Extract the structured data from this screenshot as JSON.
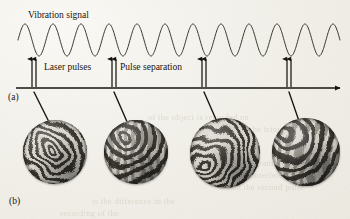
{
  "figure": {
    "caption_panels": [
      "(a)",
      "(b)"
    ],
    "background_color": "#f2f0e9",
    "ink_color": "#16150f"
  },
  "panel_a": {
    "label": "(a)",
    "signal_label": "Vibration signal",
    "laser_pulses_label": "Laser pulses",
    "pulse_separation_label": "Pulse separation",
    "axis": {
      "y": 88,
      "x_start": 16,
      "x_end": 340,
      "arrowhead": "right-arrow-icon"
    },
    "waveform": {
      "type": "sine",
      "cycles": 11.5,
      "x_start": 18,
      "x_end": 340,
      "baseline_y": 40,
      "amplitude": 16,
      "stroke_width": 0.9
    },
    "pulse_pairs": [
      {
        "index": 1,
        "x": 32,
        "separation": 4,
        "arrows": 2
      },
      {
        "index": 2,
        "x": 112,
        "separation": 4,
        "arrows": 2
      },
      {
        "index": 3,
        "x": 202,
        "separation": 4,
        "arrows": 2
      },
      {
        "index": 4,
        "x": 287,
        "separation": 4,
        "arrows": 2
      }
    ],
    "leader_lines": [
      {
        "from_x": 34,
        "from_y": 92,
        "to_x": 50,
        "to_y": 124
      },
      {
        "from_x": 114,
        "from_y": 92,
        "to_x": 128,
        "to_y": 124
      },
      {
        "from_x": 204,
        "from_y": 92,
        "to_x": 218,
        "to_y": 124
      },
      {
        "from_x": 289,
        "from_y": 92,
        "to_x": 300,
        "to_y": 124
      }
    ]
  },
  "panel_b": {
    "label": "(b)",
    "interferograms": [
      {
        "index": 1,
        "name": "interferogram-1",
        "x": 23,
        "y": 120,
        "size": 64,
        "pattern": "concentric-radial-fringes",
        "fringe_count": 26,
        "center_x": 48,
        "center_y": 46,
        "swirl": 38,
        "base_color": "#8f8c84"
      },
      {
        "index": 2,
        "name": "interferogram-2",
        "x": 104,
        "y": 120,
        "size": 64,
        "pattern": "wavy-vertical-fringes",
        "fringe_count": 22,
        "center_x": 38,
        "center_y": 34,
        "swirl": 16,
        "base_color": "#8b8881"
      },
      {
        "index": 3,
        "name": "interferogram-3",
        "x": 190,
        "y": 118,
        "size": 70,
        "pattern": "spiral-with-smooth-lobe",
        "fringe_count": 28,
        "center_x": 30,
        "center_y": 56,
        "swirl": 30,
        "base_color": "#8a8780"
      },
      {
        "index": 4,
        "name": "interferogram-4",
        "x": 272,
        "y": 118,
        "size": 68,
        "pattern": "s-curve-fringes",
        "fringe_count": 20,
        "center_x": 30,
        "center_y": 32,
        "swirl": 22,
        "base_color": "#908d85"
      }
    ]
  },
  "scan_artifacts": {
    "bleed_through_lines": [
      {
        "text": "of the object is recorded on",
        "x": 148,
        "y": 112,
        "size": 8.5
      },
      {
        "text": "the fringes which",
        "x": 250,
        "y": 124,
        "size": 8.5
      },
      {
        "text": "a hologram of the object",
        "x": 232,
        "y": 158,
        "size": 8.5
      },
      {
        "text": "the interference of the",
        "x": 238,
        "y": 170,
        "size": 8.5
      },
      {
        "text": "and the second pulse",
        "x": 228,
        "y": 182,
        "size": 8.5
      },
      {
        "text": "is the difference in the",
        "x": 92,
        "y": 196,
        "size": 8.5
      },
      {
        "text": "recording of the",
        "x": 60,
        "y": 208,
        "size": 8.5
      }
    ]
  }
}
